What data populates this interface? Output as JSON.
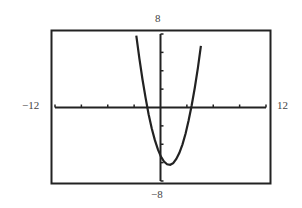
{
  "window": {
    "xmin": "-12",
    "xmax": "12",
    "ymin": "-8",
    "ymax": "8",
    "xscl": 3,
    "yscl": 2
  },
  "chart_data": {
    "type": "line",
    "title": "",
    "xlabel": "",
    "ylabel": "",
    "xlim": [
      -12,
      12
    ],
    "ylim": [
      -8,
      8
    ],
    "grid": false,
    "legend": null,
    "tick_labels": {
      "left": "-12",
      "right": "12",
      "top": "8",
      "bottom": "-8"
    },
    "x_tick_interval": 3,
    "y_tick_interval": 2,
    "series": [
      {
        "name": "parabola",
        "equation_estimate": "y = (x - 1)^2 - 6.25",
        "x_intercepts": [
          -1.5,
          3.5
        ],
        "vertex": [
          1,
          -6.25
        ],
        "y_intercept": -5.25,
        "x": [
          -2.7,
          -2,
          -1.5,
          -1,
          0,
          0.5,
          1,
          1.5,
          2,
          3,
          3.5,
          4,
          4.7
        ],
        "y": [
          7.4,
          2.75,
          0,
          -2.25,
          -5.25,
          -6,
          -6.25,
          -6,
          -5.25,
          -2.25,
          0,
          2.75,
          7.4
        ]
      }
    ]
  }
}
